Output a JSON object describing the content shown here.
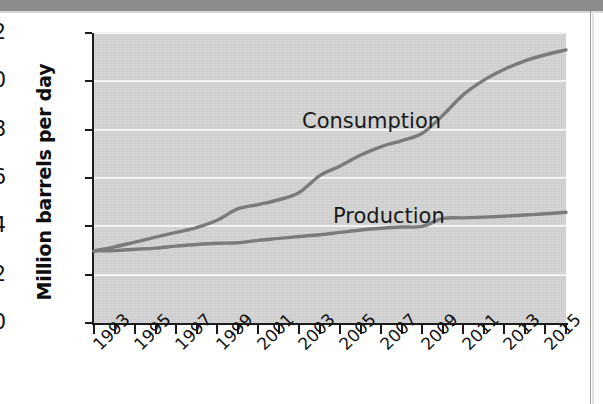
{
  "chart_data": {
    "type": "line",
    "title": "",
    "xlabel": "",
    "ylabel": "Million barrels per day",
    "xlim": [
      1993,
      2016
    ],
    "ylim": [
      0,
      12
    ],
    "grid": true,
    "legend_position": "inline-annotations",
    "y_ticks": [
      12,
      10,
      8,
      6,
      4,
      2,
      0
    ],
    "y_tick_labels": [
      "12",
      "10",
      "8",
      "6",
      "4",
      "2",
      "0"
    ],
    "x_tick_labels": [
      "1993",
      "1995",
      "1997",
      "1999",
      "2001",
      "2003",
      "2005",
      "2007",
      "2009",
      "2011",
      "2013",
      "2015"
    ],
    "x": [
      1993,
      1994,
      1995,
      1996,
      1997,
      1998,
      1999,
      2000,
      2001,
      2002,
      2003,
      2004,
      2005,
      2006,
      2007,
      2008,
      2009,
      2010,
      2011,
      2012,
      2013,
      2014,
      2015,
      2016
    ],
    "series": [
      {
        "name": "Consumption",
        "color": "#7b7b7b",
        "values": [
          2.98,
          3.15,
          3.35,
          3.55,
          3.75,
          3.95,
          4.25,
          4.72,
          4.9,
          5.1,
          5.4,
          6.1,
          6.5,
          6.95,
          7.3,
          7.55,
          7.85,
          8.6,
          9.45,
          10.05,
          10.5,
          10.85,
          11.1,
          11.3
        ]
      },
      {
        "name": "Production",
        "color": "#7b7b7b",
        "values": [
          2.98,
          3.0,
          3.05,
          3.1,
          3.18,
          3.25,
          3.3,
          3.32,
          3.42,
          3.5,
          3.58,
          3.65,
          3.75,
          3.85,
          3.92,
          3.97,
          4.0,
          4.33,
          4.35,
          4.38,
          4.42,
          4.47,
          4.52,
          4.58
        ]
      }
    ],
    "annotations": [
      {
        "text": "Consumption",
        "x": 2003.2,
        "y": 8.9
      },
      {
        "text": "Production",
        "x": 2004.7,
        "y": 5.05
      }
    ]
  }
}
